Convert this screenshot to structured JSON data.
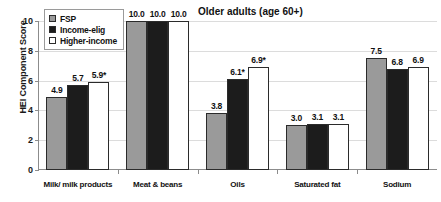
{
  "chart_data": {
    "type": "bar",
    "title": "Older adults (age 60+)",
    "xlabel": "",
    "ylabel": "HEI Component Score",
    "ylim": [
      0,
      10
    ],
    "yticks": [
      0,
      2,
      4,
      6,
      8,
      10
    ],
    "ytick_labels": [
      "0",
      "2",
      "4",
      "6",
      "8",
      "10"
    ],
    "grid": true,
    "legend_position": "top-left inside plot",
    "categories": [
      "Milk/ milk products",
      "Meat & beans",
      "Oils",
      "Saturated fat",
      "Sodium"
    ],
    "series": [
      {
        "name": "FSP",
        "color": "#9a9a9a",
        "values": [
          4.9,
          10.0,
          3.8,
          3.0,
          7.5
        ],
        "labels": [
          "4.9",
          "10.0",
          "3.8",
          "3.0",
          "7.5"
        ]
      },
      {
        "name": "Income-elig",
        "color": "#1c1c1c",
        "values": [
          5.7,
          10.0,
          6.1,
          3.1,
          6.8
        ],
        "labels": [
          "5.7",
          "10.0",
          "6.1*",
          "3.1",
          "6.8"
        ]
      },
      {
        "name": "Higher-income",
        "color": "#ffffff",
        "values": [
          5.9,
          10.0,
          6.9,
          3.1,
          6.9
        ],
        "labels": [
          "5.9*",
          "10.0",
          "6.9*",
          "3.1",
          "6.9"
        ]
      }
    ],
    "annotations": "Asterisk (*) denotes values marked on the chart: 5.9*, 6.1*, 6.9*"
  }
}
